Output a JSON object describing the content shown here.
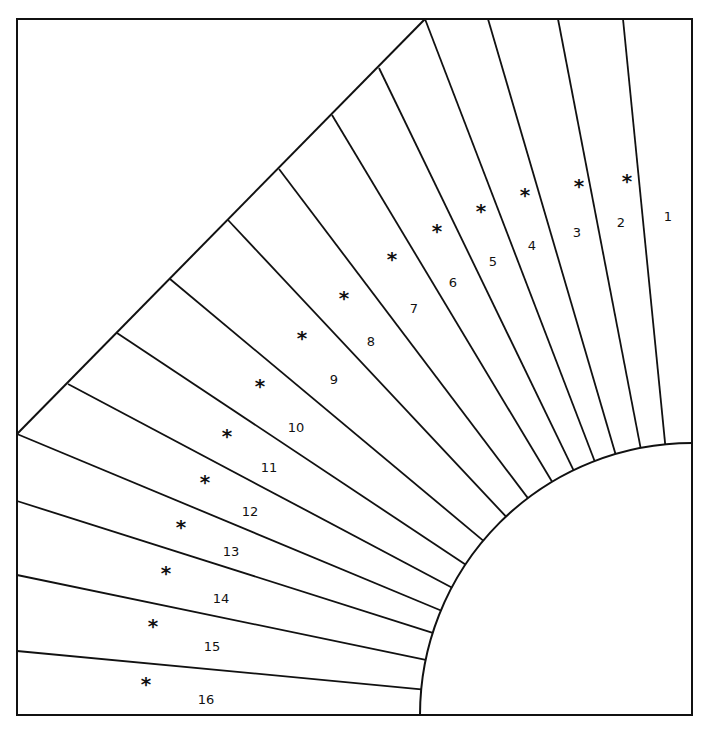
{
  "diagram": {
    "type": "quilt-block-template",
    "frame": {
      "x": 17,
      "y": 19,
      "width": 675,
      "height": 696
    },
    "center": {
      "x": 692,
      "y": 715
    },
    "inner_radius": 272,
    "stroke_color": "#111111",
    "background": "#ffffff",
    "rays_outer_points": [
      [
        623,
        19
      ],
      [
        558,
        19
      ],
      [
        488,
        19
      ],
      [
        425,
        19
      ],
      [
        379,
        68
      ],
      [
        332,
        115
      ],
      [
        279,
        169
      ],
      [
        228,
        220
      ],
      [
        170,
        279
      ],
      [
        117,
        333
      ],
      [
        68,
        384
      ],
      [
        17,
        434
      ],
      [
        17,
        501
      ],
      [
        17,
        575
      ],
      [
        17,
        651
      ]
    ],
    "segments": [
      {
        "label": "1",
        "num": [
          668,
          216
        ],
        "star": [
          627,
          176
        ]
      },
      {
        "label": "2",
        "num": [
          621,
          222
        ],
        "star": [
          627,
          176
        ]
      },
      {
        "label": "3",
        "num": [
          577,
          232
        ],
        "star": [
          579,
          181
        ]
      },
      {
        "label": "4",
        "num": [
          532,
          245
        ],
        "star": [
          525,
          190
        ]
      },
      {
        "label": "5",
        "num": [
          493,
          261
        ],
        "star": [
          481,
          206
        ]
      },
      {
        "label": "6",
        "num": [
          453,
          282
        ],
        "star": [
          437,
          226
        ]
      },
      {
        "label": "7",
        "num": [
          414,
          308
        ],
        "star": [
          392,
          254
        ]
      },
      {
        "label": "8",
        "num": [
          371,
          341
        ],
        "star": [
          344,
          293
        ]
      },
      {
        "label": "9",
        "num": [
          334,
          379
        ],
        "star": [
          302,
          333
        ]
      },
      {
        "label": "10",
        "num": [
          296,
          427
        ],
        "star": [
          260,
          381
        ]
      },
      {
        "label": "11",
        "num": [
          269,
          467
        ],
        "star": [
          227,
          431
        ]
      },
      {
        "label": "12",
        "num": [
          250,
          511
        ],
        "star": [
          205,
          477
        ]
      },
      {
        "label": "13",
        "num": [
          231,
          551
        ],
        "star": [
          181,
          522
        ]
      },
      {
        "label": "14",
        "num": [
          221,
          598
        ],
        "star": [
          166,
          568
        ]
      },
      {
        "label": "15",
        "num": [
          212,
          646
        ],
        "star": [
          153,
          621
        ]
      },
      {
        "label": "16",
        "num": [
          206,
          699
        ],
        "star": [
          146,
          679
        ]
      }
    ],
    "star_glyph": "*"
  }
}
